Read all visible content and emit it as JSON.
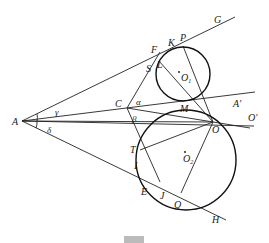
{
  "figure": {
    "points": {
      "A": "A",
      "C": "C",
      "F": "F",
      "K": "K",
      "P": "P",
      "G": "G",
      "S": "S",
      "L": "L",
      "M": "M",
      "O": "O",
      "O1": "O",
      "O1_sub": "1",
      "O2": "O",
      "O2_sub": "2",
      "A_prime": "A′",
      "O_prime": "O′",
      "T": "T",
      "I": "I",
      "E": "E",
      "J": "J",
      "Q": "Q",
      "H": "H"
    },
    "angles": {
      "alpha": "α",
      "beta": "β",
      "gamma": "γ",
      "delta": "δ"
    },
    "circles": [
      {
        "name": "O1",
        "cx": 183,
        "cy": 74,
        "r": 27
      },
      {
        "name": "O2",
        "cx": 186,
        "cy": 160,
        "r": 50
      }
    ]
  }
}
